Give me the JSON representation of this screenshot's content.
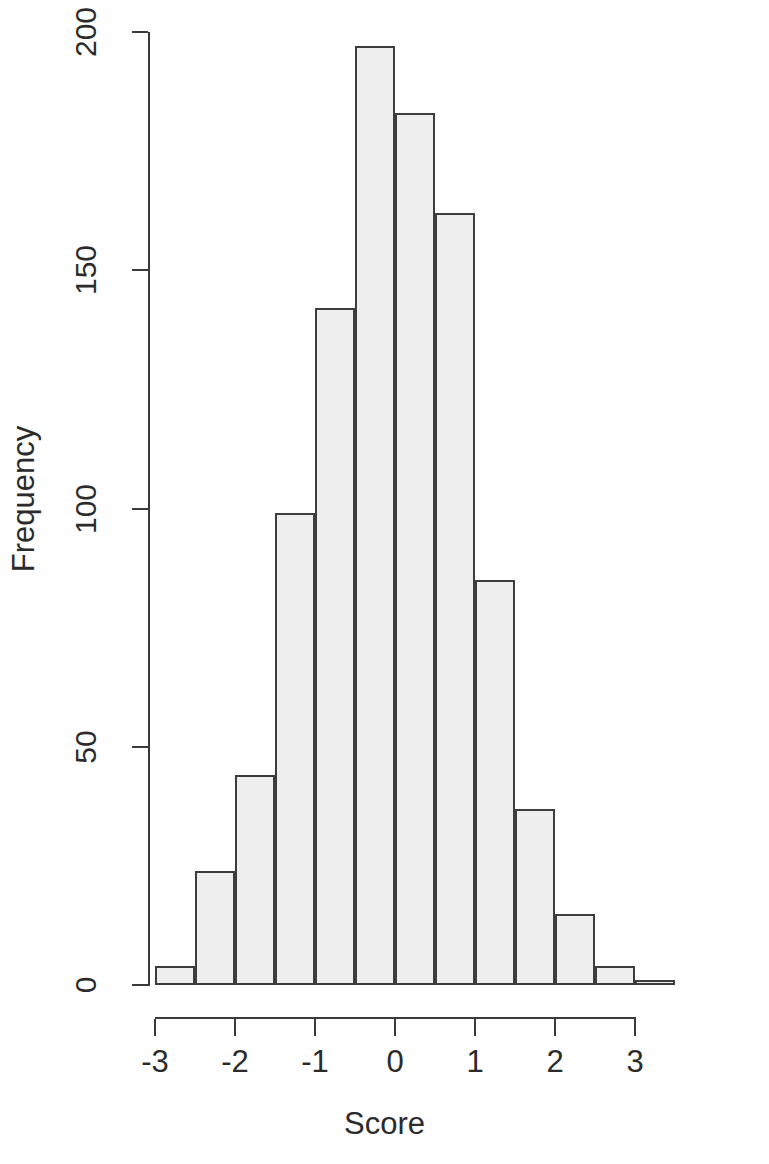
{
  "chart_data": {
    "type": "bar",
    "title": "",
    "subtitle": "",
    "xlabel": "Score",
    "ylabel": "Frequency",
    "grid": false,
    "legend": null,
    "xlim": [
      -3.0,
      3.5
    ],
    "ylim": [
      0,
      200
    ],
    "bin_width": 0.5,
    "bin_edges": [
      -3.0,
      -2.5,
      -2.0,
      -1.5,
      -1.0,
      -0.5,
      0.0,
      0.5,
      1.0,
      1.5,
      2.0,
      2.5,
      3.0,
      3.5
    ],
    "categories": [
      "[-3.0,-2.5)",
      "[-2.5,-2.0)",
      "[-2.0,-1.5)",
      "[-1.5,-1.0)",
      "[-1.0,-0.5)",
      "[-0.5,0.0)",
      "[0.0,0.5)",
      "[0.5,1.0)",
      "[1.0,1.5)",
      "[1.5,2.0)",
      "[2.0,2.5)",
      "[2.5,3.0)",
      "[3.0,3.5)"
    ],
    "values": [
      4,
      24,
      44,
      99,
      142,
      197,
      183,
      162,
      85,
      37,
      15,
      4,
      1
    ],
    "x_ticks": [
      -3,
      -2,
      -1,
      0,
      1,
      2,
      3
    ],
    "x_tick_labels": [
      "-3",
      "-2",
      "-1",
      "0",
      "1",
      "2",
      "3"
    ],
    "y_ticks": [
      0,
      50,
      100,
      150,
      200
    ],
    "y_tick_labels": [
      "0",
      "50",
      "100",
      "150",
      "200"
    ],
    "bar_fill_color": "#eeeeee",
    "bar_border_color": "#3d3d3d",
    "axis_color": "#3a3a3a"
  }
}
